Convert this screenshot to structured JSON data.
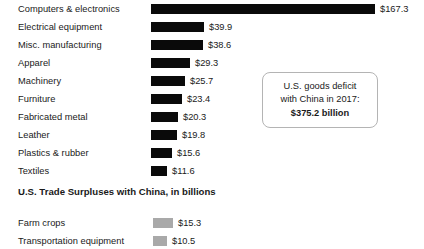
{
  "chart_data": {
    "type": "bar",
    "orientation": "horizontal",
    "title": "",
    "xlabel": "",
    "ylabel": "",
    "units": "billions of U.S. dollars",
    "grid": false,
    "legend": "none",
    "xlim": [
      0,
      167.3
    ],
    "px_per_unit": 1.338,
    "sections": [
      {
        "name": "deficits",
        "heading": "",
        "bar_color": "#0a0a0a",
        "categories": [
          "Computers & electronics",
          "Electrical equipment",
          "Misc. manufacturing",
          "Apparel",
          "Machinery",
          "Furniture",
          "Fabricated metal",
          "Leather",
          "Plastics & rubber",
          "Textiles"
        ],
        "values": [
          167.3,
          39.9,
          38.6,
          29.3,
          25.7,
          23.4,
          20.3,
          19.8,
          15.6,
          11.6
        ],
        "value_labels": [
          "$167.3",
          "$39.9",
          "$38.6",
          "$29.3",
          "$25.7",
          "$23.4",
          "$20.3",
          "$19.8",
          "$15.6",
          "$11.6"
        ]
      },
      {
        "name": "surpluses",
        "heading": "U.S. Trade Surpluses with China, in billions",
        "bar_color": "#a9a9a9",
        "categories": [
          "Farm crops",
          "Transportation equipment"
        ],
        "values": [
          15.3,
          10.5
        ],
        "value_labels": [
          "$15.3",
          "$10.5"
        ]
      }
    ],
    "annotations": [
      {
        "name": "deficit-callout",
        "line1": "U.S. goods deficit",
        "line2": "with China in 2017:",
        "line3": "$375.2 billion"
      }
    ]
  }
}
